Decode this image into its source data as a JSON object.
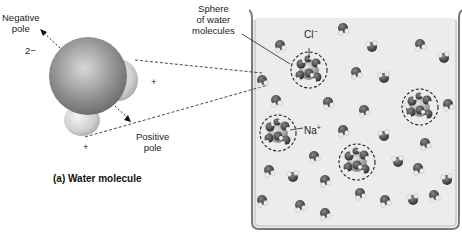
{
  "figure": {
    "panel_a": {
      "caption": "(a) Water molecule",
      "negative_pole_line1": "Negative",
      "negative_pole_line2": "pole",
      "oxygen_charge": "2−",
      "hydrogen_charge_right": "+",
      "hydrogen_charge_bottom": "+",
      "positive_pole_line1": "Positive",
      "positive_pole_line2": "pole"
    },
    "panel_b": {
      "sphere_label_line1": "Sphere",
      "sphere_label_line2": "of water",
      "sphere_label_line3": "molecules",
      "chloride_label": "Cl",
      "chloride_charge": "−",
      "sodium_label": "Na",
      "sodium_charge": "+"
    },
    "colors": {
      "oxygen": "#8a8a8a",
      "hydrogen": "#d8d8d8",
      "solution": "#ececec",
      "beaker_edge": "#7a7a7a",
      "text": "#222222"
    }
  }
}
